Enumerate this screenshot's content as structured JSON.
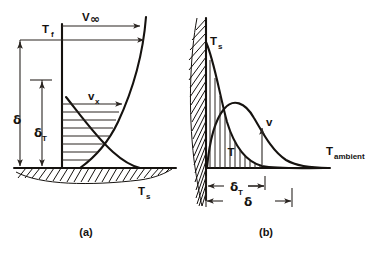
{
  "figure": {
    "background_color": "#ffffff",
    "ink_color": "#15120f",
    "panels": [
      {
        "id": "a",
        "caption": "(a)",
        "description": "Forced convection boundary layer over a horizontal heated surface",
        "labels": {
          "free_stream_velocity": "V",
          "free_stream_velocity_sub": "∞",
          "fluid_temperature": "T",
          "fluid_temperature_sub": "f",
          "velocity_profile": "v",
          "velocity_profile_sub": "x",
          "momentum_thickness": "δ",
          "thermal_thickness": "δ",
          "thermal_thickness_sub": "T",
          "surface_temperature": "T",
          "surface_temperature_sub": "s"
        }
      },
      {
        "id": "b",
        "caption": "(b)",
        "description": "Free convection boundary layer along a vertical heated wall",
        "labels": {
          "surface_temperature": "T",
          "surface_temperature_sub": "s",
          "velocity_profile": "v",
          "temperature_profile": "T",
          "ambient_temperature": "T",
          "ambient_temperature_sub": "ambient",
          "thermal_thickness": "δ",
          "thermal_thickness_sub": "T",
          "momentum_thickness": "δ"
        }
      }
    ]
  }
}
